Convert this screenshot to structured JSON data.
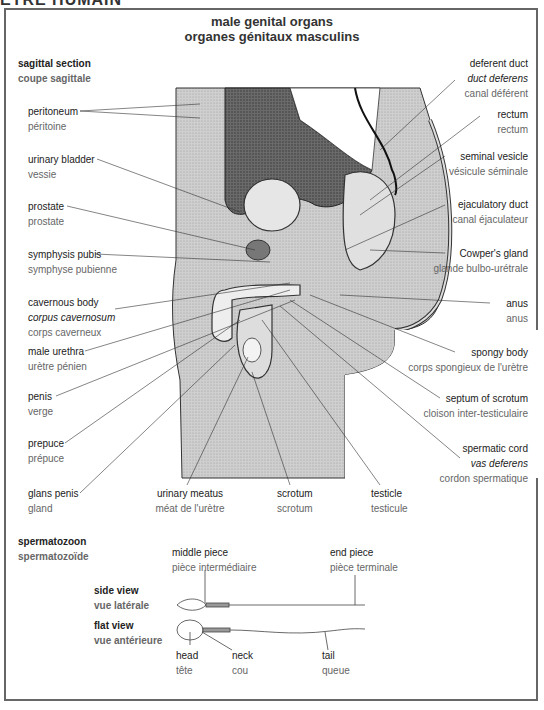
{
  "header": {
    "cutoff_text": "ÊTRE HUMAIN"
  },
  "title": {
    "en": "male genital organs",
    "fr": "organes génitaux masculins"
  },
  "section": {
    "en": "sagittal section",
    "fr": "coupe sagittale"
  },
  "left_labels": [
    {
      "en": "peritoneum",
      "fr": "péritoine"
    },
    {
      "en": "urinary bladder",
      "fr": "vessie"
    },
    {
      "en": "prostate",
      "fr": "prostate"
    },
    {
      "en": "symphysis pubis",
      "fr": "symphyse pubienne"
    },
    {
      "en": "cavernous body",
      "la": "corpus cavernosum",
      "fr": "corps caverneux"
    },
    {
      "en": "male urethra",
      "fr": "urètre pénien"
    },
    {
      "en": "penis",
      "fr": "verge"
    },
    {
      "en": "prepuce",
      "fr": "prépuce"
    },
    {
      "en": "glans penis",
      "fr": "gland"
    }
  ],
  "right_labels": [
    {
      "en": "deferent duct",
      "la": "duct deferens",
      "fr": "canal déférent"
    },
    {
      "en": "rectum",
      "fr": "rectum"
    },
    {
      "en": "seminal vesicle",
      "fr": "vésicule séminale"
    },
    {
      "en": "ejaculatory duct",
      "fr": "canal éjaculateur"
    },
    {
      "en": "Cowper's gland",
      "fr": "glande bulbo-urétrale"
    },
    {
      "en": "anus",
      "fr": "anus"
    },
    {
      "en": "spongy body",
      "fr": "corps spongieux de l'urètre"
    },
    {
      "en": "septum of scrotum",
      "fr": "cloison inter-testiculaire"
    },
    {
      "en": "spermatic cord",
      "la": "vas deferens",
      "fr": "cordon spermatique"
    }
  ],
  "bottom_labels": [
    {
      "en": "urinary meatus",
      "fr": "méat de l'urètre"
    },
    {
      "en": "scrotum",
      "fr": "scrotum"
    },
    {
      "en": "testicle",
      "fr": "testicule"
    }
  ],
  "sperm": {
    "title": {
      "en": "spermatozoon",
      "fr": "spermatozoïde"
    },
    "side_view": {
      "en": "side view",
      "fr": "vue latérale"
    },
    "flat_view": {
      "en": "flat view",
      "fr": "vue antérieure"
    },
    "parts": {
      "middle_piece": {
        "en": "middle piece",
        "fr": "pièce intermédiaire"
      },
      "end_piece": {
        "en": "end piece",
        "fr": "pièce terminale"
      },
      "head": {
        "en": "head",
        "fr": "tête"
      },
      "neck": {
        "en": "neck",
        "fr": "cou"
      },
      "tail": {
        "en": "tail",
        "fr": "queue"
      }
    }
  }
}
